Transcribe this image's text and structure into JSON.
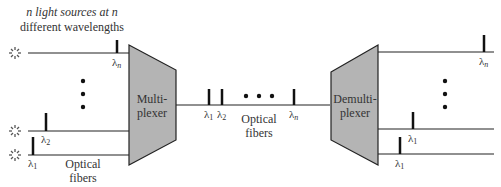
{
  "title_line1": "n light sources at n",
  "title_line2": "different wavelengths",
  "mux_line1": "Multi-",
  "mux_line2": "plexer",
  "demux_line1": "Demulti-",
  "demux_line2": "plexer",
  "fiber_left_line1": "Optical",
  "fiber_left_line2": "fibers",
  "fiber_mid_line1": "Optical",
  "fiber_mid_line2": "fibers",
  "lambda": "λ",
  "sub_1": "1",
  "sub_2": "2",
  "sub_n": "n",
  "colors": {
    "block": "#b4b4b4",
    "line": "#222222"
  }
}
